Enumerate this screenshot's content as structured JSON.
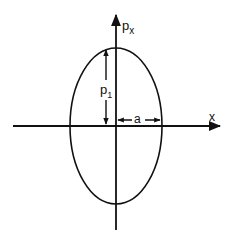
{
  "diagram": {
    "type": "phase-space ellipse",
    "axes": {
      "horizontal_label": "x",
      "vertical_label_main": "p",
      "vertical_label_sub": "x"
    },
    "dimensions": {
      "vertical_label_main": "p",
      "vertical_label_sub": "1",
      "horizontal_label": "a"
    },
    "colors": {
      "line": "#111111",
      "background": "#ffffff"
    }
  }
}
